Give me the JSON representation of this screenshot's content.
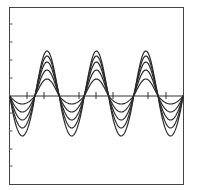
{
  "chart_data": {
    "type": "line",
    "title": "",
    "xlabel": "",
    "ylabel": "",
    "grid": false,
    "legend": null,
    "frame": {
      "left": 9.5,
      "top": 7.5,
      "right": 183.5,
      "bottom": 184.5
    },
    "zero_line_y": 96,
    "x_ticks_px": [
      27,
      44,
      79,
      96,
      113,
      148,
      166
    ],
    "y_ticks_px": [
      24,
      42,
      60,
      78,
      113,
      131,
      149,
      166
    ],
    "waveform": {
      "start_x": 10,
      "end_x": 183,
      "period_px": 49.4,
      "start_phase": "falling zero crossing",
      "periods_shown": 3.5
    },
    "series": [
      {
        "name": "curve-1",
        "peak": 17,
        "trough": 8
      },
      {
        "name": "curve-2",
        "peak": 26,
        "trough": 16
      },
      {
        "name": "curve-3",
        "peak": 34,
        "trough": 24
      },
      {
        "name": "curve-4",
        "peak": 40,
        "trough": 32
      },
      {
        "name": "curve-5",
        "peak": 45,
        "trough": 40
      }
    ],
    "colors": {
      "line": "#2a2a2a",
      "frame": "#444444",
      "background": "#ffffff"
    }
  }
}
